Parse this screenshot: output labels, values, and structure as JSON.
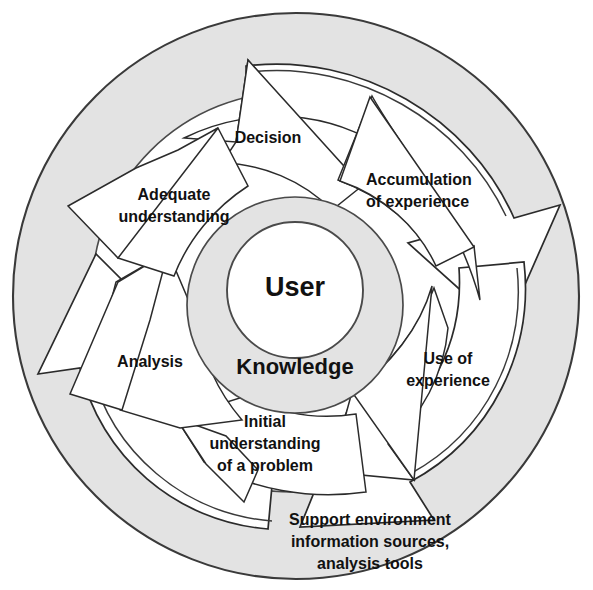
{
  "diagram": {
    "center": {
      "user_label": "User",
      "knowledge_label": "Knowledge"
    },
    "outer_band_label": {
      "line1": "Support environment",
      "line2": "information sources,",
      "line3": "analysis tools"
    },
    "stages": [
      {
        "id": "decision",
        "label": "Decision",
        "lines": [
          "Decision"
        ]
      },
      {
        "id": "accumulation",
        "label": "Accumulation of experience",
        "lines": [
          "Accumulation",
          "of experience"
        ]
      },
      {
        "id": "use",
        "label": "Use of experience",
        "lines": [
          "Use of",
          "experience"
        ]
      },
      {
        "id": "initial",
        "label": "Initial understanding of a problem",
        "lines": [
          "Initial",
          "understanding",
          "of a  problem"
        ]
      },
      {
        "id": "analysis",
        "label": "Analysis",
        "lines": [
          "Analysis"
        ]
      },
      {
        "id": "adequate",
        "label": "Adequate understanding",
        "lines": [
          "Adequate",
          "understanding"
        ]
      }
    ],
    "colors": {
      "ring_fill": "#e3e3e3",
      "arrow_fill": "#ffffff",
      "stroke": "#2b2b2b",
      "text": "#111111",
      "background": "#ffffff"
    }
  }
}
